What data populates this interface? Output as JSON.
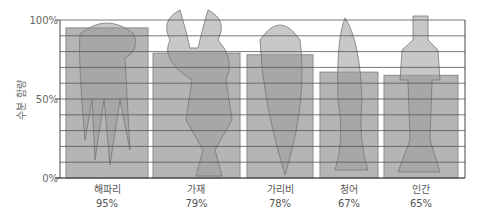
{
  "chart_data": {
    "type": "bar",
    "title": "",
    "xlabel": "",
    "ylabel": "수분 함량",
    "ylim": [
      0,
      100
    ],
    "yticks": [
      "0%",
      "50%",
      "100%"
    ],
    "grid": true,
    "grid_step": 10,
    "legend": null,
    "categories": [
      "해파리",
      "가재",
      "가리비",
      "청어",
      "인간"
    ],
    "values": [
      95,
      79,
      78,
      67,
      65
    ],
    "value_labels": [
      "95%",
      "79%",
      "78%",
      "67%",
      "65%"
    ],
    "illustrations": [
      "jellyfish",
      "crayfish",
      "scallop",
      "herring",
      "human-swimmer"
    ]
  },
  "colors": {
    "bar_fill": "#b5b5b5",
    "bar_stroke": "#8a8a8a",
    "grid": "#555555",
    "axis": "#444444",
    "background": "#ffffff"
  }
}
